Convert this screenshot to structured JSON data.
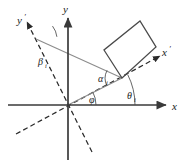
{
  "figure": {
    "background_color": "#ffffff",
    "width": 185,
    "height": 165,
    "colors": {
      "solid_axis": "#3a3a3a",
      "dashed_axis": "#2b2b2b",
      "rectangle_stroke": "#4a4a4a",
      "ray_gray": "#8c8c8c",
      "text": "#1a1a1a"
    }
  },
  "axes": [
    {
      "id": "x-axis",
      "label": "x",
      "prime": "",
      "style": "solid",
      "arrow": true,
      "description": "horizontal axis pointing right",
      "from": [
        8,
        105
      ],
      "to": [
        168,
        105
      ],
      "label_pos": [
        172,
        109
      ]
    },
    {
      "id": "y-axis",
      "label": "y",
      "prime": "",
      "style": "solid",
      "arrow": true,
      "description": "vertical axis pointing up",
      "from": [
        68,
        160
      ],
      "to": [
        68,
        16
      ],
      "label_pos": [
        64,
        12
      ]
    },
    {
      "id": "x-prime-axis",
      "label": "x",
      "prime": "′",
      "style": "dashed",
      "arrow": true,
      "description": "rotated horizontal axis pointing up-right",
      "from": [
        16,
        134
      ],
      "to": [
        160,
        56
      ],
      "label_pos": [
        164,
        54
      ]
    },
    {
      "id": "y-prime-axis",
      "label": "y",
      "prime": "′",
      "style": "dashed",
      "arrow": true,
      "description": "rotated vertical axis pointing up-left",
      "from": [
        92,
        152
      ],
      "to": [
        27,
        22
      ],
      "label_pos": [
        20,
        20
      ]
    }
  ],
  "rays": [
    {
      "id": "ray-theta",
      "description": "gray ray from origin to rectangle corner, makes angle theta with x axis",
      "style": "solid-gray",
      "from": [
        68,
        105
      ],
      "to": [
        122,
        78
      ]
    },
    {
      "id": "ray-beta",
      "description": "gray ray from rectangle corner up-left past y prime axis",
      "style": "solid-gray",
      "from": [
        122,
        78
      ],
      "to": [
        36,
        39
      ]
    }
  ],
  "rectangle": {
    "id": "inclined-rectangle",
    "description": "elongated rectangle tilted, one corner resting on the x-prime axis",
    "corners": [
      [
        122,
        78
      ],
      [
        104,
        50
      ],
      [
        140,
        21
      ],
      [
        156,
        47
      ]
    ]
  },
  "angles": [
    {
      "id": "angle-alpha",
      "symbol": "α",
      "subscript": "i",
      "label_pos": [
        102,
        79
      ],
      "description": "angle between rectangle long side and x-prime axis at rectangle corner"
    },
    {
      "id": "angle-beta",
      "symbol": "β",
      "subscript": "i",
      "label_pos": [
        42,
        62
      ],
      "description": "angle between y-prime axis and gray ray"
    },
    {
      "id": "angle-theta",
      "symbol": "θ",
      "subscript": "i",
      "label_pos": [
        131,
        96
      ],
      "description": "angle between x axis and gray ray to rectangle corner"
    },
    {
      "id": "angle-phi",
      "symbol": "φ",
      "subscript": "",
      "label_pos": [
        93,
        100
      ],
      "description": "angle between x axis and x-prime axis at origin"
    }
  ],
  "arcs": [
    {
      "id": "arc-alpha",
      "center": [
        122,
        78
      ],
      "radius": 17,
      "start_deg": 153,
      "end_deg": 208
    },
    {
      "id": "arc-beta",
      "center": [
        36,
        39
      ],
      "radius": 21,
      "start_deg": 6,
      "end_deg": 38
    },
    {
      "id": "arc-theta",
      "center": [
        68,
        105
      ],
      "radius": 67,
      "start_deg": 0,
      "end_deg": 27
    },
    {
      "id": "arc-phi",
      "center": [
        68,
        105
      ],
      "radius": 28,
      "start_deg": 0,
      "end_deg": 28
    }
  ]
}
